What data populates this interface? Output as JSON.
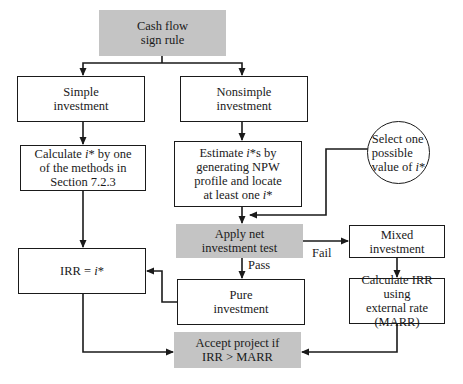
{
  "colors": {
    "line": "#1a1a1a",
    "shaded_fill": "#c4c4c4",
    "background": "#ffffff"
  },
  "nodes": {
    "cash_flow_sign_rule": {
      "lines": [
        "Cash flow",
        "sign rule"
      ]
    },
    "simple_investment": {
      "lines": [
        "Simple",
        "investment"
      ]
    },
    "nonsimple_investment": {
      "lines": [
        "Nonsimple",
        "investment"
      ]
    },
    "calculate_i_star": {
      "lines": [
        "Calculate i* by one",
        "of the methods in",
        "Section 7.2.3"
      ]
    },
    "estimate_i_stars": {
      "lines": [
        "Estimate i*s by",
        "generating NPW",
        "profile and locate",
        "at least one i*"
      ]
    },
    "select_one_value": {
      "lines": [
        "Select one",
        "possible",
        "value of i*"
      ]
    },
    "apply_net_investment_test": {
      "lines": [
        "Apply net",
        "investment test"
      ]
    },
    "mixed_investment": {
      "lines": [
        "Mixed",
        "investment"
      ]
    },
    "irr_equals_i_star": {
      "lines": [
        "IRR = i*"
      ]
    },
    "pure_investment": {
      "lines": [
        "Pure",
        "investment"
      ]
    },
    "calculate_irr_external": {
      "lines": [
        "Calculate IRR using",
        "external rate",
        "(MARR)"
      ]
    },
    "accept_project": {
      "lines": [
        "Accept project if",
        "IRR > MARR"
      ]
    }
  },
  "edge_labels": {
    "pass": "Pass",
    "fail": "Fail"
  },
  "edges": [
    {
      "from": "cash_flow_sign_rule",
      "to": "simple_investment"
    },
    {
      "from": "cash_flow_sign_rule",
      "to": "nonsimple_investment"
    },
    {
      "from": "simple_investment",
      "to": "calculate_i_star"
    },
    {
      "from": "nonsimple_investment",
      "to": "estimate_i_stars"
    },
    {
      "from": "calculate_i_star",
      "to": "irr_equals_i_star"
    },
    {
      "from": "estimate_i_stars",
      "to": "apply_net_investment_test"
    },
    {
      "from": "select_one_value",
      "to": "apply_net_investment_test"
    },
    {
      "from": "apply_net_investment_test",
      "to": "pure_investment",
      "label": "Pass"
    },
    {
      "from": "apply_net_investment_test",
      "to": "mixed_investment",
      "label": "Fail"
    },
    {
      "from": "pure_investment",
      "to": "irr_equals_i_star"
    },
    {
      "from": "mixed_investment",
      "to": "calculate_irr_external"
    },
    {
      "from": "irr_equals_i_star",
      "to": "accept_project"
    },
    {
      "from": "calculate_irr_external",
      "to": "accept_project"
    }
  ]
}
